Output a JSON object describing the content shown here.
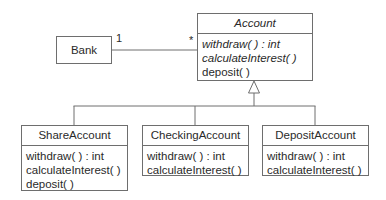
{
  "diagram": {
    "type": "UML class diagram",
    "classes": {
      "bank": {
        "name": "Bank"
      },
      "account": {
        "name": "Account",
        "abstract": true,
        "operations": [
          {
            "label": "withdraw( ) : int",
            "abstract": true
          },
          {
            "label": "calculateInterest( )",
            "abstract": true
          },
          {
            "label": "deposit( )",
            "abstract": false
          }
        ]
      },
      "share_account": {
        "name": "ShareAccount",
        "operations": [
          {
            "label": "withdraw( ) : int"
          },
          {
            "label": "calculateInterest( )"
          },
          {
            "label": "deposit( )"
          }
        ]
      },
      "checking_account": {
        "name": "CheckingAccount",
        "operations": [
          {
            "label": "withdraw( ) : int"
          },
          {
            "label": "calculateInterest( )"
          }
        ]
      },
      "deposit_account": {
        "name": "DepositAccount",
        "operations": [
          {
            "label": "withdraw( ) : int"
          },
          {
            "label": "calculateInterest( )"
          }
        ]
      }
    },
    "relationships": {
      "association": {
        "from": "Bank",
        "to": "Account",
        "from_multiplicity": "1",
        "to_multiplicity": "*"
      },
      "generalization": {
        "parent": "Account",
        "children": [
          "ShareAccount",
          "CheckingAccount",
          "DepositAccount"
        ]
      }
    },
    "colors": {
      "line": "#6e6e6e",
      "text": "#2a2a2a",
      "background": "#ffffff"
    }
  }
}
